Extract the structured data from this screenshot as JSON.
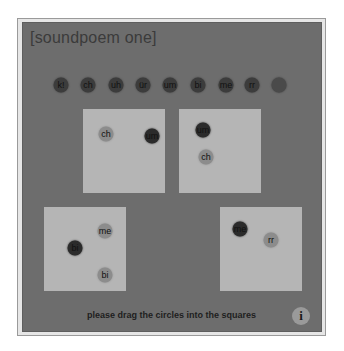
{
  "app": {
    "title": "[soundpoem one]",
    "instruction": "please drag the circles into the squares",
    "info_button": {
      "label": "i",
      "icon": "info-icon"
    }
  },
  "palette": {
    "stage_background": "#6d6d6d",
    "square_fill": "#b5b5b5",
    "circle_dark": "#2b2b2b",
    "circle_mid": "#8c8c8c",
    "text_dark": "#3b3b3b"
  },
  "source_circles": [
    {
      "label": "k!"
    },
    {
      "label": "ch"
    },
    {
      "label": "uh"
    },
    {
      "label": "ür"
    },
    {
      "label": "um"
    },
    {
      "label": "bi"
    },
    {
      "label": "me"
    },
    {
      "label": "rr"
    },
    {
      "label": ""
    }
  ],
  "squares": [
    {
      "name": "square-1",
      "circles": [
        {
          "label": "ch",
          "tone": "mid"
        },
        {
          "label": "um",
          "tone": "dark"
        }
      ]
    },
    {
      "name": "square-2",
      "circles": [
        {
          "label": "um",
          "tone": "dark"
        },
        {
          "label": "ch",
          "tone": "mid"
        }
      ]
    },
    {
      "name": "square-3",
      "circles": [
        {
          "label": "me",
          "tone": "mid"
        },
        {
          "label": "bi",
          "tone": "dark"
        },
        {
          "label": "bi",
          "tone": "mid"
        }
      ]
    },
    {
      "name": "square-4",
      "circles": [
        {
          "label": "me",
          "tone": "dark"
        },
        {
          "label": "rr",
          "tone": "mid"
        }
      ]
    }
  ]
}
